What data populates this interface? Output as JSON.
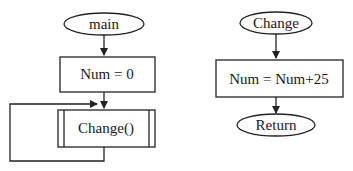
{
  "diagram": {
    "type": "flowchart",
    "main_flow": {
      "start": {
        "label": "main",
        "shape": "terminator"
      },
      "steps": [
        {
          "label": "Num = 0",
          "shape": "process"
        },
        {
          "label": "Change()",
          "shape": "predefined-process"
        }
      ],
      "loop": {
        "from": "Change()",
        "to": "Change()",
        "description": "loop back to input of Change()"
      }
    },
    "subroutine_flow": {
      "start": {
        "label": "Change",
        "shape": "terminator"
      },
      "steps": [
        {
          "label": "Num = Num+25",
          "shape": "process"
        }
      ],
      "end": {
        "label": "Return",
        "shape": "terminator"
      }
    }
  },
  "colors": {
    "stroke": "#222222",
    "background": "#ffffff",
    "text": "#1a1a1a"
  }
}
